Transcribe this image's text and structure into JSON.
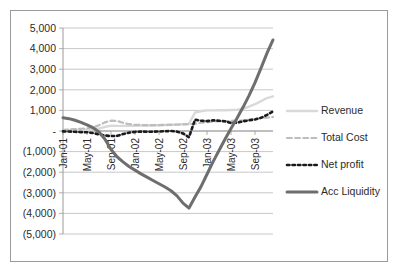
{
  "chart_data": {
    "type": "line",
    "title": "",
    "subtitle": "",
    "xlabel": "",
    "ylabel": "",
    "grid": true,
    "legend_position": "right",
    "ylim": [
      -5000,
      5000
    ],
    "ytick_labels": [
      "5,000",
      "4,000",
      "3,000",
      "2,000",
      "1,000",
      "-",
      "(1,000)",
      "(2,000)",
      "(3,000)",
      "(4,000)",
      "(5,000)"
    ],
    "ytick_values": [
      5000,
      4000,
      3000,
      2000,
      1000,
      0,
      -1000,
      -2000,
      -3000,
      -4000,
      -5000
    ],
    "x": [
      "Jan-01",
      "Feb-01",
      "Mar-01",
      "Apr-01",
      "May-01",
      "Jun-01",
      "Jul-01",
      "Aug-01",
      "Sep-01",
      "Oct-01",
      "Nov-01",
      "Dec-01",
      "Jan-02",
      "Feb-02",
      "Mar-02",
      "Apr-02",
      "May-02",
      "Jun-02",
      "Jul-02",
      "Aug-02",
      "Sep-02",
      "Oct-02",
      "Nov-02",
      "Dec-02",
      "Jan-03",
      "Feb-03",
      "Mar-03",
      "Apr-03",
      "May-03",
      "Jun-03",
      "Jul-03",
      "Aug-03",
      "Sep-03",
      "Oct-03",
      "Nov-03",
      "Dec-03"
    ],
    "xtick_labels": [
      "Jan-01",
      "May-01",
      "Sep-01",
      "Jan-02",
      "May-02",
      "Sep-02",
      "Jan-03",
      "May-03",
      "Sep-03"
    ],
    "xtick_indices": [
      0,
      4,
      8,
      12,
      16,
      20,
      24,
      28,
      32
    ],
    "series": [
      {
        "name": "Revenue",
        "color": "#d9d9d9",
        "style": "solid",
        "width": 2.4,
        "values": [
          40,
          45,
          50,
          55,
          60,
          70,
          120,
          200,
          255,
          250,
          250,
          250,
          255,
          260,
          265,
          270,
          280,
          290,
          300,
          310,
          330,
          350,
          900,
          960,
          1000,
          1000,
          1010,
          1010,
          1020,
          1030,
          1080,
          1180,
          1300,
          1450,
          1600,
          1680
        ]
      },
      {
        "name": "Total Cost",
        "color": "#bdbdbd",
        "style": "dashed",
        "width": 2.2,
        "values": [
          55,
          70,
          90,
          110,
          130,
          170,
          280,
          420,
          500,
          490,
          400,
          330,
          300,
          290,
          285,
          285,
          290,
          295,
          300,
          310,
          320,
          330,
          350,
          400,
          430,
          460,
          470,
          480,
          490,
          500,
          520,
          550,
          590,
          620,
          650,
          680
        ]
      },
      {
        "name": "Net profit",
        "color": "#1a1a1a",
        "style": "dotted",
        "width": 2.6,
        "values": [
          -20,
          -25,
          -40,
          -55,
          -60,
          -100,
          -160,
          -220,
          -245,
          -240,
          -150,
          -80,
          -45,
          -30,
          -35,
          -35,
          -25,
          -10,
          0,
          -30,
          -120,
          -300,
          550,
          500,
          480,
          520,
          500,
          470,
          390,
          400,
          470,
          520,
          560,
          640,
          780,
          950
        ]
      },
      {
        "name": "Acc Liquidity",
        "color": "#6e6e6e",
        "style": "solid",
        "width": 3.0,
        "values": [
          640,
          600,
          520,
          420,
          300,
          160,
          -50,
          -400,
          -900,
          -1250,
          -1500,
          -1720,
          -1900,
          -2080,
          -2240,
          -2400,
          -2560,
          -2720,
          -2900,
          -3150,
          -3500,
          -3740,
          -3200,
          -2700,
          -2100,
          -1500,
          -950,
          -400,
          120,
          620,
          1150,
          1720,
          2350,
          3050,
          3780,
          4420
        ]
      }
    ]
  },
  "legend": {
    "items": [
      {
        "label": "Revenue"
      },
      {
        "label": "Total Cost"
      },
      {
        "label": "Net profit"
      },
      {
        "label": "Acc Liquidity"
      }
    ]
  },
  "colors": {
    "border": "#9a9a9a",
    "grid": "#b9b9b9",
    "text": "#2b2b2b",
    "background": "#ffffff"
  }
}
